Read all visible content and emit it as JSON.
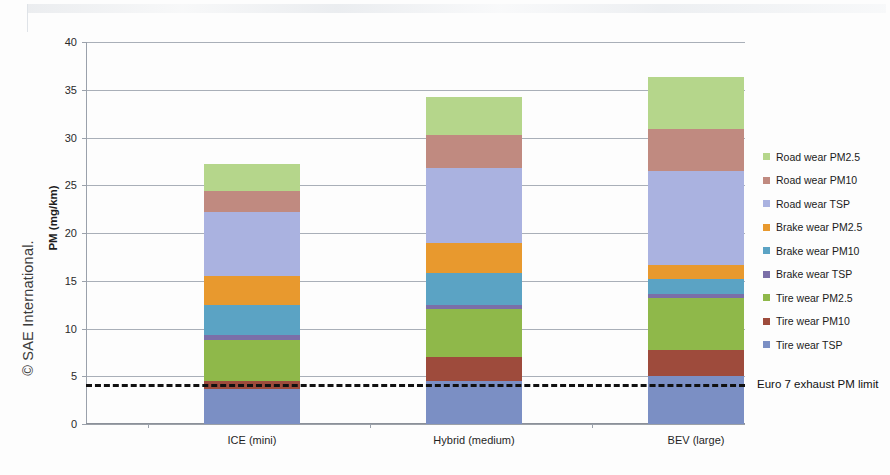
{
  "watermark": "© SAE International.",
  "chart_data": {
    "type": "bar",
    "subtype": "stacked-vertical",
    "title": "",
    "xlabel": "",
    "ylabel": "PM (mg/km)",
    "ylim": [
      0,
      40
    ],
    "ytick_step": 5,
    "yticks": [
      0,
      5,
      10,
      15,
      20,
      25,
      30,
      35,
      40
    ],
    "grid": true,
    "legend_position": "right",
    "categories": [
      "ICE (mini)",
      "Hybrid (medium)",
      "BEV (large)"
    ],
    "series": [
      {
        "name": "Tire wear TSP",
        "color": "#7b8fc4",
        "values": [
          3.7,
          4.5,
          5.0
        ]
      },
      {
        "name": "Tire wear PM10",
        "color": "#9e4b3c",
        "values": [
          0.8,
          2.5,
          2.8
        ]
      },
      {
        "name": "Tire wear PM2.5",
        "color": "#8fb84a",
        "values": [
          4.3,
          5.0,
          5.4
        ]
      },
      {
        "name": "Brake wear TSP",
        "color": "#7b6fa8",
        "values": [
          0.5,
          0.5,
          0.4
        ]
      },
      {
        "name": "Brake wear PM10",
        "color": "#5ba3c4",
        "values": [
          3.2,
          3.3,
          1.6
        ]
      },
      {
        "name": "Brake wear PM2.5",
        "color": "#e8992e",
        "values": [
          3.0,
          3.2,
          1.4
        ]
      },
      {
        "name": "Road wear TSP",
        "color": "#aab2e0",
        "values": [
          6.7,
          7.8,
          9.9
        ]
      },
      {
        "name": "Road wear PM10",
        "color": "#c08a80",
        "values": [
          2.2,
          3.5,
          4.4
        ]
      },
      {
        "name": "Road wear PM2.5",
        "color": "#b5d68b",
        "values": [
          2.8,
          3.9,
          5.4
        ]
      }
    ],
    "totals": [
      27.2,
      34.2,
      36.3
    ],
    "threshold": {
      "label": "Euro 7 exhaust PM limit",
      "value": 4.2,
      "color": "#111111",
      "style": "dashed"
    }
  },
  "legend": {
    "items": [
      {
        "label": "Road wear PM2.5",
        "color": "#b5d68b"
      },
      {
        "label": "Road wear PM10",
        "color": "#c08a80"
      },
      {
        "label": "Road wear TSP",
        "color": "#aab2e0"
      },
      {
        "label": "Brake wear PM2.5",
        "color": "#e8992e"
      },
      {
        "label": "Brake wear PM10",
        "color": "#5ba3c4"
      },
      {
        "label": "Brake wear TSP",
        "color": "#7b6fa8"
      },
      {
        "label": "Tire wear PM2.5",
        "color": "#8fb84a"
      },
      {
        "label": "Tire wear PM10",
        "color": "#9e4b3c"
      },
      {
        "label": "Tire wear TSP",
        "color": "#7b8fc4"
      }
    ]
  }
}
